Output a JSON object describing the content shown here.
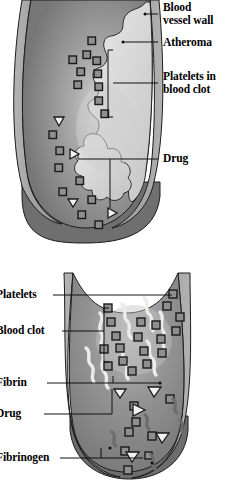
{
  "figure": {
    "type": "biomedical-illustration",
    "title_visible": false,
    "panels": [
      {
        "id": "panel-top",
        "name": "atherosclerotic-vessel-with-clot",
        "description": "Longitudinal cut-away of a blood vessel narrowed by atheroma with platelets forming a clot",
        "labels": [
          {
            "key": "blood_vessel_wall",
            "text": "Blood\nvessel wall",
            "x": 163,
            "y": 2,
            "leader": "dot"
          },
          {
            "key": "atheroma",
            "text": "Atheroma",
            "x": 163,
            "y": 38,
            "leader": "dot"
          },
          {
            "key": "platelets_in_blood_clot",
            "text": "Platelets in\nblood clot",
            "x": 163,
            "y": 68,
            "leader": "bracket"
          },
          {
            "key": "drug",
            "text": "Drug",
            "x": 163,
            "y": 152,
            "leader": "bracket"
          }
        ]
      },
      {
        "id": "panel-bottom",
        "name": "clot-with-fibrin-and-drug",
        "description": "Cross-cut vessel segment filled with blood clot showing fibrin strands, platelets, drug and fibrinogen",
        "labels": [
          {
            "key": "platelets",
            "text": "Platelets",
            "x": 0,
            "y": 288,
            "leader": "line"
          },
          {
            "key": "blood_clot",
            "text": "Blood clot",
            "x": 0,
            "y": 325,
            "leader": "bracket"
          },
          {
            "key": "fibrin",
            "text": "Fibrin",
            "x": 0,
            "y": 376,
            "leader": "line"
          },
          {
            "key": "drug",
            "text": "Drug",
            "x": 0,
            "y": 407,
            "leader": "bracket"
          },
          {
            "key": "fibrinogen",
            "text": "Fibrinogen",
            "x": 0,
            "y": 451,
            "leader": "bracket"
          }
        ]
      }
    ],
    "legend_keys": {
      "platelet": "dark-square",
      "drug": "light-triangle",
      "fibrin": "white-wavy-strand",
      "fibrinogen": "dark-gray-squiggle",
      "atheroma": "light-scalloped-mass"
    },
    "colors": {
      "vessel_wall": "#9d9d9d",
      "vessel_wall_shadow": "#8a8a8a",
      "lumen": "#8c8c8c",
      "lumen_dark": "#6f6f6f",
      "cut_face_dark": "#6b6b6b",
      "atheroma_light": "#dcdcdc",
      "fibrin_white": "#eceae4",
      "fibrinogen_gray": "#6d6d6d",
      "platelet_fill": "#8f8f8f",
      "platelet_stroke": "#1a1a1a",
      "drug_fill": "#f2f2f2",
      "drug_stroke": "#1a1a1a",
      "outline": "#1c1c1c",
      "leader": "#111111",
      "background": "#ffffff",
      "text": "#000000"
    }
  }
}
